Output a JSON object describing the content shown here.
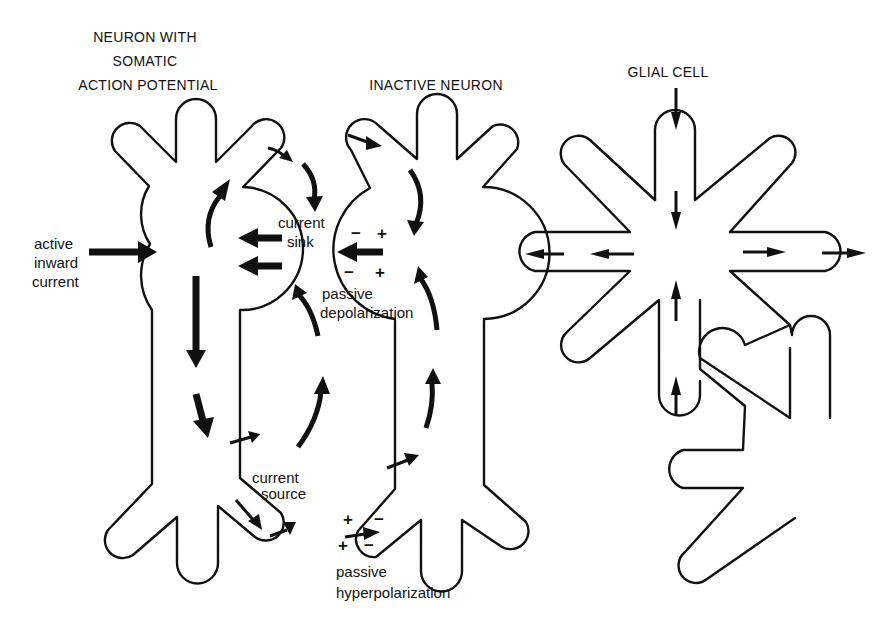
{
  "figure": {
    "panels": [
      {
        "id": "active-neuron",
        "title_lines": [
          "NEURON WITH",
          "SOMATIC",
          "ACTION POTENTIAL"
        ]
      },
      {
        "id": "inactive-neuron",
        "title_lines": [
          "INACTIVE NEURON"
        ]
      },
      {
        "id": "glial-cell",
        "title_lines": [
          "GLIAL CELL"
        ]
      }
    ],
    "labels": {
      "active_inward_current": [
        "active",
        "inward",
        "current"
      ],
      "current_sink": [
        "current",
        "sink"
      ],
      "passive_depolarization": [
        "passive",
        "depolarization"
      ],
      "current_source": [
        "current",
        "source"
      ],
      "passive_hyperpolarization": [
        "passive",
        "hyperpolarization"
      ]
    },
    "signs": {
      "depol_top_left": "−",
      "depol_top_right": "+",
      "depol_bottom_left": "−",
      "depol_bottom_right": "+",
      "hyper_top_left": "+",
      "hyper_top_right": "−",
      "hyper_bottom_left": "+",
      "hyper_bottom_right": "−"
    },
    "colors": {
      "ink": "#111111",
      "background": "#ffffff"
    }
  }
}
